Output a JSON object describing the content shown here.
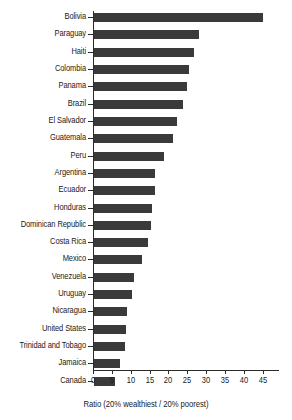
{
  "chart_data": {
    "type": "bar",
    "orientation": "horizontal",
    "title": "",
    "subtitle": "",
    "xlabel": "Ratio (20% wealthiest / 20% poorest)",
    "ylabel": "",
    "xlim": [
      0,
      45
    ],
    "xticks": [
      0,
      5,
      10,
      15,
      20,
      25,
      30,
      35,
      40,
      45
    ],
    "xtick_labels": [
      "0",
      "5",
      "10",
      "15",
      "20",
      "25",
      "30",
      "35",
      "40",
      "45"
    ],
    "grid": false,
    "legend": null,
    "bar_color": "#3a3a3a",
    "axis_color": "#2b2b2b",
    "background": "#ffffff",
    "categories": [
      "Bolivia",
      "Paraguay",
      "Haiti",
      "Colombia",
      "Panama",
      "Brazil",
      "El Salvador",
      "Guatemala",
      "Peru",
      "Argentina",
      "Ecuador",
      "Honduras",
      "Dominican Republic",
      "Costa Rica",
      "Mexico",
      "Venezuela",
      "Uruguay",
      "Nicaragua",
      "United States",
      "Trinidad and Tobago",
      "Jamaica",
      "Canada"
    ],
    "values": [
      44.8,
      27.8,
      26.6,
      25.3,
      24.7,
      23.7,
      22.1,
      20.9,
      18.6,
      16.3,
      16.2,
      15.3,
      15.0,
      14.3,
      12.8,
      10.6,
      10.0,
      8.8,
      8.4,
      8.3,
      6.9,
      5.6
    ]
  }
}
